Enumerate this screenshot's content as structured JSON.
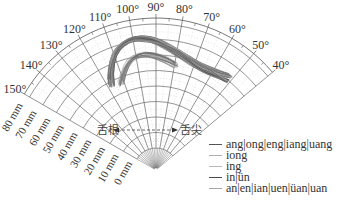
{
  "chart_data": {
    "type": "polar-line",
    "title": "",
    "angular_axis": {
      "ticks": [
        "150°",
        "140°",
        "130°",
        "120°",
        "110°",
        "100°",
        "90°",
        "80°",
        "70°",
        "60°",
        "50°",
        "40°"
      ],
      "range_deg": [
        40,
        150
      ]
    },
    "radial_axis": {
      "ticks": [
        "0 mm",
        "10 mm",
        "20 mm",
        "30 mm",
        "40 mm",
        "50 mm",
        "60 mm",
        "70 mm",
        "80 mm"
      ],
      "range_mm": [
        0,
        80
      ]
    },
    "annotations": {
      "back": "舌根",
      "front": "舌尖"
    },
    "legend": [
      {
        "label": "ang|ong|eng|iang|uang",
        "color": "#555555"
      },
      {
        "label": "iong",
        "color": "#b0b0b0"
      },
      {
        "label": "ing",
        "color": "#b8b8b8"
      },
      {
        "label": "in|ün",
        "color": "#4a4a4a"
      },
      {
        "label": "an|en|ian|uen|üan|uan",
        "color": "#a8a8a8"
      }
    ],
    "series_description": "Bundle of tongue-contour traces arcing from ~115° near 60 mm radius, peaking ~95°-100° at ~70 mm, descending toward ~50° at ~60 mm"
  }
}
